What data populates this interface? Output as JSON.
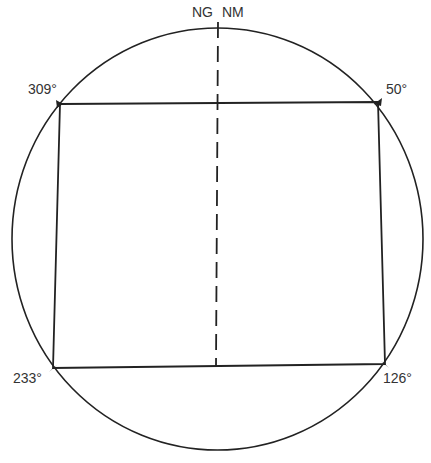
{
  "diagram": {
    "type": "compass-traverse",
    "north_labels": {
      "grid": "NG",
      "magnetic": "NM"
    },
    "corners": [
      {
        "bearing": "309°",
        "x": 60,
        "y": 104
      },
      {
        "bearing": "50°",
        "x": 378,
        "y": 102
      },
      {
        "bearing": "126°",
        "x": 385,
        "y": 364
      },
      {
        "bearing": "233°",
        "x": 53,
        "y": 368
      }
    ],
    "colors": {
      "line": "#222222",
      "text": "#333333",
      "background": "#ffffff"
    }
  }
}
